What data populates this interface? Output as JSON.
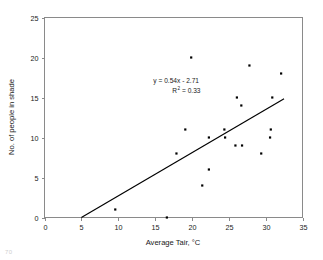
{
  "chart_data": {
    "type": "scatter",
    "title": "",
    "xlabel": "Average Tair, °C",
    "ylabel": "No. of people in shade",
    "xlim": [
      0,
      35
    ],
    "ylim": [
      0,
      25
    ],
    "xticks": [
      0,
      5,
      10,
      15,
      20,
      25,
      30,
      35
    ],
    "yticks": [
      0,
      5,
      10,
      15,
      20,
      25
    ],
    "xtick_labels": [
      "0",
      "5",
      "10",
      "15",
      "20",
      "25",
      "30",
      "35"
    ],
    "ytick_labels": [
      "0",
      "5",
      "10",
      "15",
      "20",
      "25"
    ],
    "grid": false,
    "legend": false,
    "marker_color": "#000000",
    "trendline_color": "#000000",
    "axis_color": "#8a8a8a",
    "points": [
      {
        "x": 9.6,
        "y": 1
      },
      {
        "x": 16.6,
        "y": 0
      },
      {
        "x": 17.9,
        "y": 8
      },
      {
        "x": 19.1,
        "y": 11
      },
      {
        "x": 19.9,
        "y": 20
      },
      {
        "x": 21.4,
        "y": 4
      },
      {
        "x": 22.3,
        "y": 6
      },
      {
        "x": 22.3,
        "y": 10
      },
      {
        "x": 24.4,
        "y": 11
      },
      {
        "x": 24.5,
        "y": 10
      },
      {
        "x": 25.9,
        "y": 9
      },
      {
        "x": 26.1,
        "y": 15
      },
      {
        "x": 26.7,
        "y": 14
      },
      {
        "x": 26.8,
        "y": 9
      },
      {
        "x": 27.8,
        "y": 19
      },
      {
        "x": 29.4,
        "y": 8
      },
      {
        "x": 30.6,
        "y": 10
      },
      {
        "x": 30.7,
        "y": 11
      },
      {
        "x": 30.9,
        "y": 15
      },
      {
        "x": 32.1,
        "y": 18
      }
    ],
    "trendline": {
      "equation": "y = 0.54x - 2.71",
      "slope": 0.54,
      "intercept": -2.71,
      "r_squared_label": "R",
      "r_squared_exponent": "2",
      "r_squared_value": "= 0.33",
      "r_squared": 0.33,
      "x_start": 5.0,
      "x_end": 32.5
    },
    "annotations": [
      {
        "text": "y = 0.54x - 2.71",
        "x": 20.3,
        "y": 16.6
      },
      {
        "text": "R² = 0.33",
        "x": 20.3,
        "y": 15.2
      }
    ]
  },
  "artifact": {
    "corner_text": "70"
  }
}
